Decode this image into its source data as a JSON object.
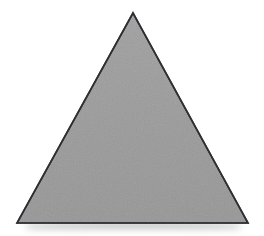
{
  "canvas": {
    "width": 264,
    "height": 236,
    "background_color": "#ffffff",
    "description": "Single gray outlined triangle on a plain white background"
  },
  "figure": {
    "name": "triangle",
    "shape_type": "triangle",
    "orientation": "apex-up",
    "classification": "isosceles",
    "sides": 3,
    "vertices": [
      {
        "label": "apex",
        "x": 133,
        "y": 13
      },
      {
        "label": "bottom-left",
        "x": 17,
        "y": 223
      },
      {
        "label": "bottom-right",
        "x": 248,
        "y": 223
      }
    ],
    "base_width": 231,
    "height": 210,
    "fill_color": "#9a9a9a",
    "fill_color_secondary": "#a3a3a3",
    "stroke_color": "#2e2e33",
    "stroke_width": 1.6,
    "texture": "subtle-grain"
  },
  "shadow": {
    "name": "ground-shadow",
    "color": "#9a9a9a",
    "top_y": 224,
    "height": 12,
    "left_x": 26,
    "width": 214,
    "opacity": 0.45,
    "blur": 4
  }
}
